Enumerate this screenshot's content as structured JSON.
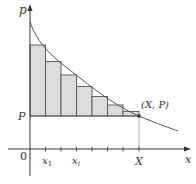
{
  "diagram": {
    "type": "consumer surplus Riemann sum",
    "axes": {
      "y_label": "p",
      "x_label": "x",
      "origin_label": "0"
    },
    "labels": {
      "price_level": "P",
      "point": "(X, P)",
      "x_end": "X",
      "x_first": "x",
      "x_first_sub": "1",
      "x_i": "x",
      "x_i_sub": "i"
    },
    "rectangles": {
      "count": 7,
      "fill": "#dcdcdc",
      "stroke": "#555555"
    },
    "colors": {
      "axis": "#333333",
      "curve": "#555555",
      "background": "#ffffff"
    }
  }
}
